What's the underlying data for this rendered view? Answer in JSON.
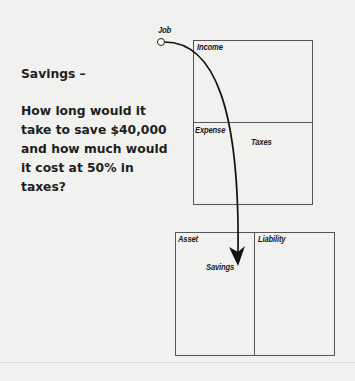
{
  "title": "Savings –",
  "question_lines": [
    "How long would it",
    "take to save $40,000",
    "and how much would",
    "it cost at 50% in",
    "taxes?"
  ],
  "diagram": {
    "source_label": "Job",
    "income_statement": {
      "income_label": "Income",
      "expense_label": "Expense",
      "taxes_label": "Taxes"
    },
    "balance_sheet": {
      "asset_label": "Asset",
      "liability_label": "Liability",
      "savings_label": "Savings"
    },
    "arrow_color": "#111111"
  }
}
